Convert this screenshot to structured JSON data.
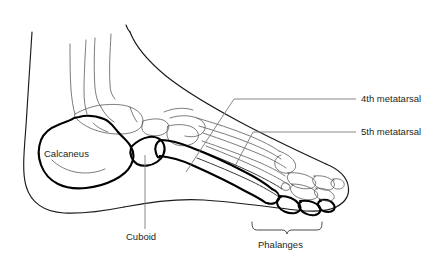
{
  "figure": {
    "background_color": "#ffffff",
    "width": 441,
    "height": 264,
    "line_color": "#1a1a1a",
    "highlight_color": "#000000",
    "leader_color": "#7a7a7a",
    "text_color": "#231f20"
  },
  "labels": {
    "calcaneus": "Calcaneus",
    "cuboid": "Cuboid",
    "metatarsal_4": "4th metatarsal",
    "metatarsal_5": "5th metatarsal",
    "phalanges": "Phalanges"
  },
  "annotations": [
    {
      "name": "calcaneus",
      "text": "Calcaneus",
      "kind": "inline-label",
      "x": 44,
      "y": 157
    },
    {
      "name": "cuboid",
      "text": "Cuboid",
      "kind": "leader-vertical",
      "x": 126,
      "y": 240
    },
    {
      "name": "metatarsal-4",
      "text": "4th metatarsal",
      "kind": "leader-elbow",
      "x": 361,
      "y": 102
    },
    {
      "name": "metatarsal-5",
      "text": "5th metatarsal",
      "kind": "leader-elbow",
      "x": 361,
      "y": 135
    },
    {
      "name": "phalanges",
      "text": "Phalanges",
      "kind": "brace",
      "x": 258,
      "y": 248
    }
  ]
}
